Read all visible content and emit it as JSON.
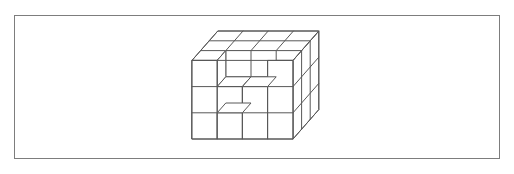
{
  "figure": {
    "shape_type": "unit-cube-stack",
    "line_color": "#585858",
    "fill_color": "#ffffff",
    "background_color": "#ffffff",
    "frame": {
      "border_color": "#7d7d7d",
      "border_width": 1,
      "x": 14,
      "y": 15,
      "width": 486,
      "height": 144
    },
    "dimensions": {
      "width_units": 4,
      "height_units": 3,
      "depth_units": 3,
      "total_full_blocks": 36,
      "removed_blocks": 5,
      "visible_blocks": 31
    },
    "projection": {
      "type": "oblique",
      "cell_width": 25.2,
      "cell_height": 26.2,
      "depth_dx": 8.6,
      "depth_dy": -9.8,
      "origin_x": 192,
      "origin_y": 139
    },
    "front_face": {
      "columns": 4,
      "rows": 3,
      "notch_present": true,
      "notch_description": "stepped cut at top-left of front face spanning columns 2-3"
    },
    "top_face": {
      "columns": 4,
      "depth_rows": 3,
      "notch_present": true
    },
    "right_face": {
      "rows": 3,
      "depth_columns": 3
    }
  }
}
